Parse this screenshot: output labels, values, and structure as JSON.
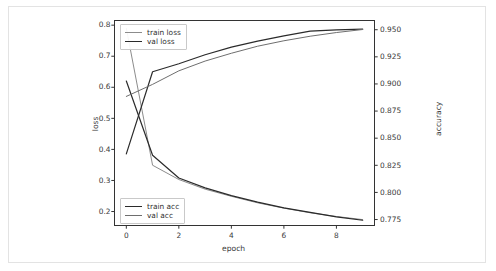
{
  "figure": {
    "background_color": "#ffffff",
    "frame_color": "#e3e3e3",
    "axes_color": "#333333"
  },
  "chart_data": {
    "type": "line",
    "title": "",
    "xlabel": "epoch",
    "ylabel": "loss",
    "y2label": "accuracy",
    "xlim": [
      -0.45,
      9.45
    ],
    "ylim": [
      0.155,
      0.815
    ],
    "y2lim": [
      0.7695,
      0.9585
    ],
    "xticks": [
      0,
      2,
      4,
      6,
      8
    ],
    "xticklabels": [
      "0",
      "2",
      "4",
      "6",
      "8"
    ],
    "yticks": [
      0.2,
      0.3,
      0.4,
      0.5,
      0.6,
      0.7,
      0.8
    ],
    "yticklabels": [
      "0.2",
      "0.3",
      "0.4",
      "0.5",
      "0.6",
      "0.7",
      "0.8"
    ],
    "y2ticks": [
      0.775,
      0.8,
      0.825,
      0.85,
      0.875,
      0.9,
      0.925,
      0.95
    ],
    "y2ticklabels": [
      "0.775",
      "0.800",
      "0.825",
      "0.850",
      "0.875",
      "0.900",
      "0.925",
      "0.950"
    ],
    "grid": false,
    "x": [
      0,
      1,
      2,
      3,
      4,
      5,
      6,
      7,
      8,
      9
    ],
    "series": [
      {
        "name": "train loss",
        "axis": "left",
        "color": "#8c8c8c",
        "linewidth": 1.0,
        "values": [
          0.79,
          0.349,
          0.303,
          0.272,
          0.249,
          0.228,
          0.211,
          0.196,
          0.184,
          0.174
        ]
      },
      {
        "name": "val loss",
        "axis": "left",
        "color": "#2b2b2b",
        "linewidth": 1.2,
        "values": [
          0.62,
          0.381,
          0.308,
          0.276,
          0.251,
          0.23,
          0.212,
          0.197,
          0.183,
          0.172
        ]
      },
      {
        "name": "train acc",
        "axis": "right",
        "color": "#2b2b2b",
        "linewidth": 1.2,
        "values": [
          0.8355,
          0.9112,
          0.9186,
          0.9269,
          0.934,
          0.9395,
          0.9444,
          0.9487,
          0.9498,
          0.9505
        ]
      },
      {
        "name": "val acc",
        "axis": "right",
        "color": "#6e6e6e",
        "linewidth": 1.0,
        "values": [
          0.8885,
          0.8996,
          0.9121,
          0.9211,
          0.9283,
          0.9348,
          0.9398,
          0.944,
          0.9474,
          0.9502
        ]
      }
    ],
    "legends": [
      {
        "name": "loss-legend",
        "position": "upper left",
        "entries": [
          {
            "label": "train loss",
            "color": "#8c8c8c"
          },
          {
            "label": "val loss",
            "color": "#2b2b2b"
          }
        ]
      },
      {
        "name": "accuracy-legend",
        "position": "lower left",
        "entries": [
          {
            "label": "train acc",
            "color": "#2b2b2b"
          },
          {
            "label": "val acc",
            "color": "#6e6e6e"
          }
        ]
      }
    ]
  }
}
